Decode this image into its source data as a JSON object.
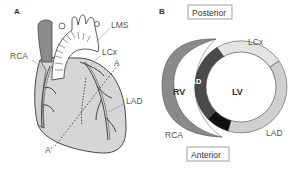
{
  "panel_a": {
    "letter": "A",
    "labels": {
      "rca": "RCA",
      "lms": "LMS",
      "lcx": "LCx",
      "lad": "LAD",
      "section_top": "A",
      "section_bottom": "A'"
    }
  },
  "panel_b": {
    "letter": "B",
    "posterior": "Posterior",
    "anterior": "Anterior",
    "labels": {
      "lcx": "LCx",
      "lad_septal": "LAD",
      "lad_anterior": "LAD",
      "rca": "RCA",
      "rv": "RV",
      "lv": "LV"
    },
    "colors": {
      "rca_territory": "#8a8a8a",
      "lad_septal": "#4a4a4a",
      "apex_black": "#111111",
      "lcx_territory": "#e4e4e4",
      "lad_anterior": "#cfcfcf",
      "heart_fill": "#d6d6d6",
      "aorta_dark": "#8c8c8c"
    }
  }
}
